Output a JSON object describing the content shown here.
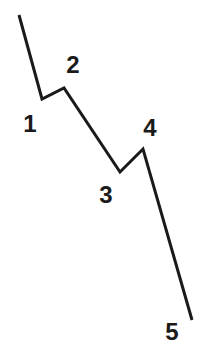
{
  "diagram": {
    "type": "elliott-wave-impulse",
    "line_color": "#1a1a1a",
    "label_color": "#1a1a1a",
    "start_point": {
      "x": 19,
      "y": 15
    },
    "waves": [
      {
        "label": "1",
        "vertex": {
          "x": 42,
          "y": 99
        },
        "label_pos": {
          "x": 30,
          "y": 132
        }
      },
      {
        "label": "2",
        "vertex": {
          "x": 64,
          "y": 88
        },
        "label_pos": {
          "x": 73,
          "y": 73
        }
      },
      {
        "label": "3",
        "vertex": {
          "x": 120,
          "y": 172
        },
        "label_pos": {
          "x": 106,
          "y": 203
        }
      },
      {
        "label": "4",
        "vertex": {
          "x": 143,
          "y": 149
        },
        "label_pos": {
          "x": 150,
          "y": 136
        }
      },
      {
        "label": "5",
        "vertex": {
          "x": 192,
          "y": 320
        },
        "label_pos": {
          "x": 172,
          "y": 340
        }
      }
    ]
  }
}
